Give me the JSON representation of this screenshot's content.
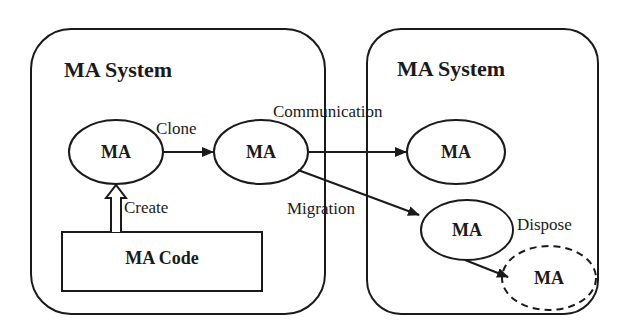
{
  "diagram": {
    "systems": [
      {
        "id": "left",
        "title": "MA System"
      },
      {
        "id": "right",
        "title": "MA System"
      }
    ],
    "nodes": [
      {
        "id": "ma1",
        "label": "MA",
        "style": "solid"
      },
      {
        "id": "ma2",
        "label": "MA",
        "style": "solid"
      },
      {
        "id": "ma3",
        "label": "MA",
        "style": "solid"
      },
      {
        "id": "ma4",
        "label": "MA",
        "style": "solid"
      },
      {
        "id": "ma5",
        "label": "MA",
        "style": "dashed"
      }
    ],
    "code_box": {
      "label": "MA Code"
    },
    "edges": [
      {
        "from": "code",
        "to": "ma1",
        "label": "Create",
        "style": "hollow-arrow"
      },
      {
        "from": "ma1",
        "to": "ma2",
        "label": "Clone"
      },
      {
        "from": "ma2",
        "to": "ma3",
        "label": "Communication"
      },
      {
        "from": "ma2",
        "to": "ma4",
        "label": "Migration"
      },
      {
        "from": "ma4",
        "to": "ma5",
        "label": "Dispose"
      }
    ],
    "colors": {
      "stroke": "#1a1a1a",
      "background": "#ffffff"
    }
  }
}
